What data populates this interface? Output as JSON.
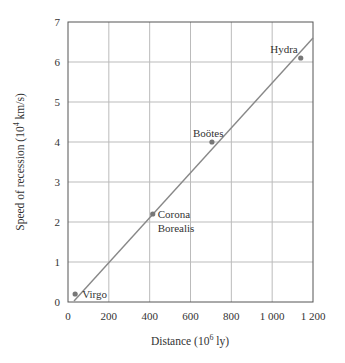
{
  "chart_data": {
    "type": "scatter",
    "title": "",
    "xlabel": "Distance (10^6 ly)",
    "xlabel_main": "Distance (10",
    "xlabel_exp": "6",
    "xlabel_tail": " ly)",
    "ylabel": "Speed of recession (10^4 km/s)",
    "ylabel_main": "Speed of recession (10",
    "ylabel_exp": "4",
    "ylabel_tail": " km/s)",
    "xlim": [
      0,
      1200
    ],
    "ylim": [
      0,
      7
    ],
    "grid": true,
    "x_ticks": [
      "0",
      "200",
      "400",
      "600",
      "800",
      "1 000",
      "1 200"
    ],
    "y_ticks": [
      "0",
      "1",
      "2",
      "3",
      "4",
      "5",
      "6",
      "7"
    ],
    "points": [
      {
        "name": "Virgo",
        "x": 35,
        "y": 0.2
      },
      {
        "name": "Corona Borealis",
        "label_lines": [
          "Corona",
          "Borealis"
        ],
        "x": 415,
        "y": 2.2
      },
      {
        "name": "Boötes",
        "x": 705,
        "y": 4.0
      },
      {
        "name": "Hydra",
        "x": 1140,
        "y": 6.1
      }
    ],
    "fit_line": {
      "x0": 0,
      "y0": 0,
      "x1": 1200,
      "y1": 6.6
    },
    "colors": {
      "line": "#888888",
      "grid": "#bbbbbb",
      "point": "#777777",
      "axis": "#555555"
    }
  }
}
